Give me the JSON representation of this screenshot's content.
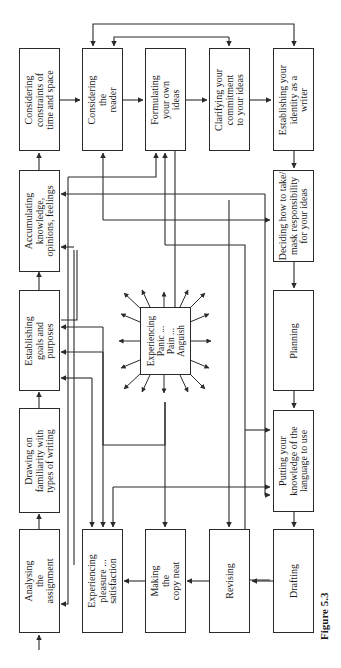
{
  "figure": {
    "caption": "Figure 5.3",
    "orientation": "rotated -90deg (landscape figure on portrait page)"
  },
  "boxes": {
    "analysing": "Analysing\nthe\nassignment",
    "drawing": "Drawing on\nfamiliarity with\ntypes of writing",
    "establishing_goals": "Establishing\ngoals and\npurposes",
    "accumulating": "Accumulating\nknowledge,\nopinions, feelings",
    "constraints": "Considering\nconstraints of\ntime and space",
    "reader": "Considering\nthe\nreader",
    "formulating": "Formulating\nyour own\nideas",
    "clarifying": "Clarifying your\ncommitment\nto your ideas",
    "identity": "Establishing your\nidentity as a\nwriter",
    "deciding": "Deciding how to take/\nmask responsibility\nfor your ideas",
    "planning": "Planning",
    "putting": "Putting your\nknowledge of the\nlanguage to use",
    "drafting": "Drafting",
    "revising": "Revising",
    "making_neat": "Making\nthe\ncopy neat",
    "pleasure": "Experiencing\npleasure ...\nsatisfaction",
    "panic": "Experiencing\nPanic ...\nPain ...\nAnguish"
  },
  "colors": {
    "line": "#2a2a2a",
    "background": "#ffffff"
  }
}
